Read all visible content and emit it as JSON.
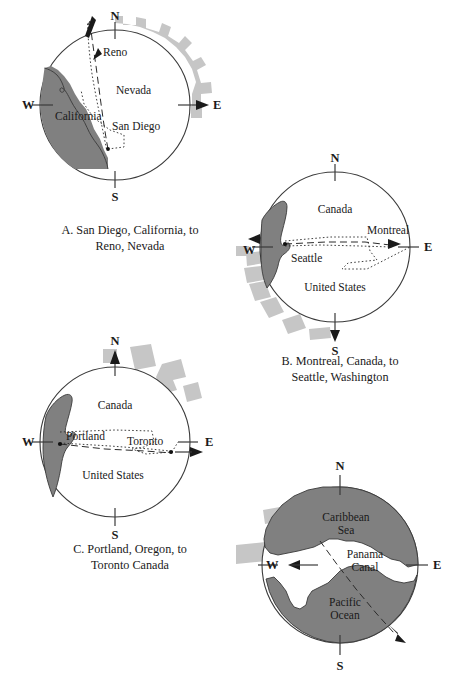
{
  "figure": {
    "colors": {
      "land_fill": "#808080",
      "arc_decoration": "#c6c6c6",
      "outline": "#3a3a3a",
      "background": "#ffffff",
      "route_line": "#2b2b2b"
    }
  },
  "compass": {
    "north": "N",
    "south": "S",
    "east": "E",
    "west": "W"
  },
  "panels": [
    {
      "id": "A",
      "caption": "A. San Diego, California, to\nReno, Nevada",
      "origin": "San Diego",
      "destination": "Reno",
      "region_labels": [
        "Nevada",
        "California"
      ],
      "city_labels": [
        "Reno",
        "San Diego"
      ],
      "labels": {
        "reno": "Reno",
        "nevada": "Nevada",
        "california": "California",
        "san_diego": "San Diego"
      }
    },
    {
      "id": "B",
      "caption": "B. Montreal, Canada, to\nSeattle, Washington",
      "origin": "Montreal",
      "destination": "Seattle",
      "region_labels": [
        "Canada",
        "United States"
      ],
      "city_labels": [
        "Seattle",
        "Montreal"
      ],
      "labels": {
        "canada": "Canada",
        "montreal": "Montreal",
        "seattle": "Seattle",
        "united_states": "United States"
      }
    },
    {
      "id": "C",
      "caption": "C. Portland, Oregon, to\nToronto Canada",
      "origin": "Portland",
      "destination": "Toronto",
      "region_labels": [
        "Canada",
        "United States"
      ],
      "city_labels": [
        "Portland",
        "Toronto"
      ],
      "labels": {
        "canada": "Canada",
        "portland": "Portland",
        "toronto": "Toronto",
        "united_states": "United States"
      }
    },
    {
      "id": "D",
      "caption": "",
      "region_labels": [
        "Caribbean Sea",
        "Panama Canal",
        "Pacific Ocean"
      ],
      "labels": {
        "caribbean_line1": "Caribbean",
        "caribbean_line2": "Sea",
        "panama_line1": "Panama",
        "panama_line2": "Canal",
        "pacific_line1": "Pacific",
        "pacific_line2": "Ocean"
      }
    }
  ]
}
